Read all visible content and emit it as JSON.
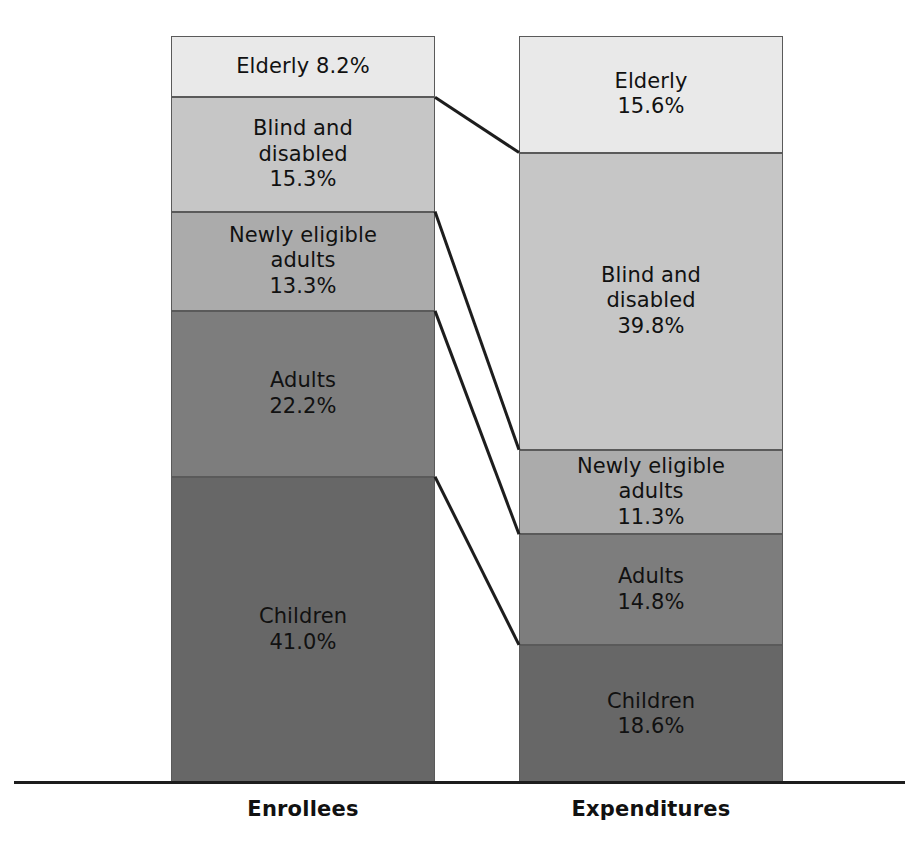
{
  "chart_data": {
    "type": "bar",
    "subtype": "stacked-100-percent-paired",
    "title": "",
    "subtitle": "",
    "xlabel": "",
    "ylabel": "",
    "grid": false,
    "legend_position": "none",
    "ylim": [
      0,
      100
    ],
    "categories": [
      "Enrollees",
      "Expenditures"
    ],
    "stack_order_top_to_bottom": [
      "Elderly",
      "Blind and disabled",
      "Newly eligible adults",
      "Adults",
      "Children"
    ],
    "series": [
      {
        "name": "Elderly",
        "values": [
          8.2,
          15.6
        ],
        "color": "#e9e9e9"
      },
      {
        "name": "Blind and disabled",
        "values": [
          15.3,
          39.8
        ],
        "color": "#c6c6c6"
      },
      {
        "name": "Newly eligible adults",
        "values": [
          13.3,
          11.3
        ],
        "color": "#ababab"
      },
      {
        "name": "Adults",
        "values": [
          22.2,
          14.8
        ],
        "color": "#7d7d7d"
      },
      {
        "name": "Children",
        "values": [
          41.0,
          18.6
        ],
        "color": "#676767"
      }
    ],
    "annotations": [
      "Elderly 8.2%",
      "Blind and\ndisabled\n15.3%",
      "Newly eligible\nadults\n13.3%",
      "Adults\n22.2%",
      "Children\n41.0%",
      "Elderly\n15.6%",
      "Blind and\ndisabled\n39.8%",
      "Newly eligible\nadults\n11.3%",
      "Adults\n14.8%",
      "Children\n18.6%"
    ]
  },
  "columns": [
    {
      "key": "enrollees",
      "label": "Enrollees",
      "segments": [
        {
          "key": "elderly",
          "name": "Elderly",
          "value": 8.2,
          "label": "Elderly 8.2%",
          "color": "#e9e9e9"
        },
        {
          "key": "blind",
          "name": "Blind and disabled",
          "value": 15.3,
          "label": "Blind and\ndisabled\n15.3%",
          "color": "#c6c6c6"
        },
        {
          "key": "newly",
          "name": "Newly eligible adults",
          "value": 13.3,
          "label": "Newly eligible\nadults\n13.3%",
          "color": "#ababab"
        },
        {
          "key": "adults",
          "name": "Adults",
          "value": 22.2,
          "label": "Adults\n22.2%",
          "color": "#7d7d7d"
        },
        {
          "key": "children",
          "name": "Children",
          "value": 41.0,
          "label": "Children\n41.0%",
          "color": "#676767"
        }
      ]
    },
    {
      "key": "expenditures",
      "label": "Expenditures",
      "segments": [
        {
          "key": "elderly",
          "name": "Elderly",
          "value": 15.6,
          "label": "Elderly\n15.6%",
          "color": "#e9e9e9"
        },
        {
          "key": "blind",
          "name": "Blind and disabled",
          "value": 39.8,
          "label": "Blind and\ndisabled\n39.8%",
          "color": "#c6c6c6"
        },
        {
          "key": "newly",
          "name": "Newly eligible adults",
          "value": 11.3,
          "label": "Newly eligible\nadults\n11.3%",
          "color": "#ababab"
        },
        {
          "key": "adults",
          "name": "Adults",
          "value": 14.8,
          "label": "Adults\n14.8%",
          "color": "#7d7d7d"
        },
        {
          "key": "children",
          "name": "Children",
          "value": 18.6,
          "label": "Children\n18.6%",
          "color": "#676767"
        }
      ]
    }
  ],
  "connector_color": "#1d1d1d",
  "axis_color": "#1d1d1d",
  "background_color": "#ffffff"
}
